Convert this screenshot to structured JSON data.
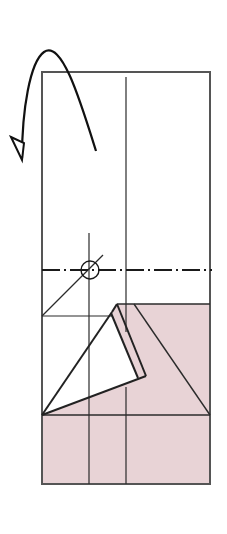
{
  "diagram": {
    "type": "origami-fold-step",
    "colors": {
      "background": "#ffffff",
      "paper_front": "#ffffff",
      "paper_back": "#e8d3d6",
      "line": "#2b2b2b",
      "outline": "#555555"
    },
    "paper": {
      "x": 42,
      "y": 72,
      "width": 168,
      "height": 412
    },
    "symbols": {
      "turn_over_arrow": "turn-over-arrow",
      "circle_marker": {
        "cx": 90,
        "cy": 270,
        "r": 9
      },
      "valley_fold_line": {
        "y": 270,
        "style": "dash-dot"
      }
    }
  }
}
